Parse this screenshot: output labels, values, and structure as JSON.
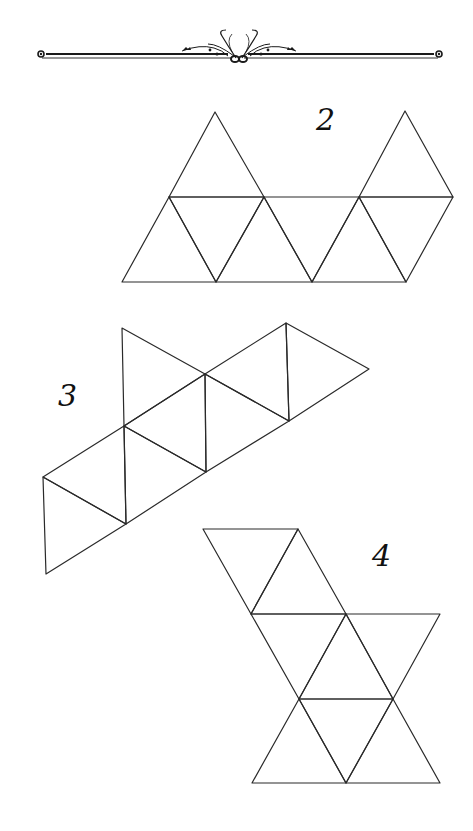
{
  "page": {
    "background": "#ffffff",
    "line_color": "#2a2a2a"
  },
  "ornament": {
    "type": "decorative-divider",
    "left_x": 38,
    "right_x": 443,
    "y": 55
  },
  "nets": [
    {
      "id": "net-2",
      "label": "2",
      "label_pos": [
        316,
        130
      ],
      "triangles": [
        [
          [
            215,
            112
          ],
          [
            169,
            197
          ],
          [
            264,
            197
          ]
        ],
        [
          [
            405,
            111
          ],
          [
            359,
            197
          ],
          [
            453,
            197
          ]
        ],
        [
          [
            169,
            197
          ],
          [
            122,
            282
          ],
          [
            216,
            282
          ]
        ],
        [
          [
            169,
            197
          ],
          [
            264,
            197
          ],
          [
            216,
            282
          ]
        ],
        [
          [
            264,
            197
          ],
          [
            216,
            282
          ],
          [
            312,
            282
          ]
        ],
        [
          [
            264,
            197
          ],
          [
            359,
            197
          ],
          [
            312,
            282
          ]
        ],
        [
          [
            359,
            197
          ],
          [
            312,
            282
          ],
          [
            406,
            282
          ]
        ],
        [
          [
            359,
            197
          ],
          [
            453,
            197
          ],
          [
            406,
            282
          ]
        ]
      ]
    },
    {
      "id": "net-3",
      "label": "3",
      "label_pos": [
        58,
        406
      ],
      "triangles": [
        [
          [
            122,
            328
          ],
          [
            205,
            374
          ],
          [
            124,
            426
          ]
        ],
        [
          [
            205,
            374
          ],
          [
            286,
            323
          ],
          [
            289,
            421
          ]
        ],
        [
          [
            286,
            323
          ],
          [
            369,
            369
          ],
          [
            289,
            421
          ]
        ],
        [
          [
            124,
            426
          ],
          [
            205,
            374
          ],
          [
            206,
            472
          ]
        ],
        [
          [
            205,
            374
          ],
          [
            289,
            421
          ],
          [
            206,
            472
          ]
        ],
        [
          [
            43,
            477
          ],
          [
            124,
            426
          ],
          [
            126,
            524
          ]
        ],
        [
          [
            124,
            426
          ],
          [
            206,
            472
          ],
          [
            126,
            524
          ]
        ],
        [
          [
            43,
            477
          ],
          [
            126,
            524
          ],
          [
            46,
            574
          ]
        ]
      ]
    },
    {
      "id": "net-4",
      "label": "4",
      "label_pos": [
        372,
        566
      ],
      "triangles": [
        [
          [
            203,
            529
          ],
          [
            298,
            529
          ],
          [
            251,
            614
          ]
        ],
        [
          [
            298,
            529
          ],
          [
            251,
            614
          ],
          [
            346,
            614
          ]
        ],
        [
          [
            251,
            614
          ],
          [
            346,
            614
          ],
          [
            299,
            699
          ]
        ],
        [
          [
            346,
            614
          ],
          [
            440,
            614
          ],
          [
            393,
            699
          ]
        ],
        [
          [
            346,
            614
          ],
          [
            299,
            699
          ],
          [
            393,
            699
          ]
        ],
        [
          [
            299,
            699
          ],
          [
            252,
            783
          ],
          [
            346,
            783
          ]
        ],
        [
          [
            299,
            699
          ],
          [
            393,
            699
          ],
          [
            346,
            783
          ]
        ],
        [
          [
            393,
            699
          ],
          [
            346,
            783
          ],
          [
            440,
            783
          ]
        ]
      ]
    }
  ]
}
